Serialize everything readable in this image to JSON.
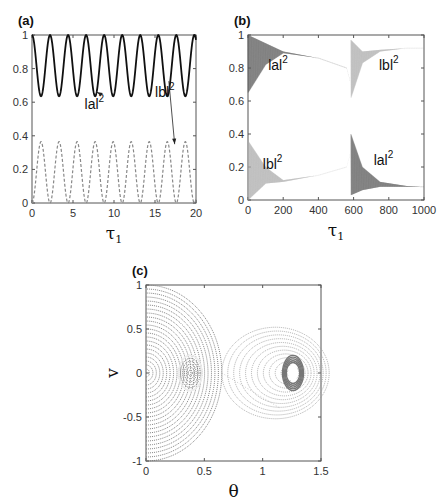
{
  "chart_data": [
    {
      "id": "a",
      "type": "line",
      "panel_label": "(a)",
      "xlabel": "τ",
      "xlabel_sub": "1",
      "ylabel": "",
      "xlim": [
        0,
        20
      ],
      "ylim": [
        0,
        1
      ],
      "xticks": [
        "0",
        "5",
        "10",
        "15",
        "20"
      ],
      "xtick_values": [
        0,
        5,
        10,
        15,
        20
      ],
      "yticks": [
        "0",
        "0.2",
        "0.4",
        "0.6",
        "0.8",
        "1"
      ],
      "ytick_values": [
        0,
        0.2,
        0.4,
        0.6,
        0.8,
        1
      ],
      "period": 2.2,
      "series": [
        {
          "name": "|a|²",
          "style": "solid",
          "color": "#111111",
          "min": 0.635,
          "max": 1.0
        },
        {
          "name": "|b|²",
          "style": "dashed",
          "color": "#888888",
          "min": 0.0,
          "max": 0.365
        }
      ],
      "annotations": [
        {
          "text": "lal",
          "sup": "2",
          "x": 7.6,
          "y": 0.56,
          "arrow_to": [
            7.9,
            0.66
          ]
        },
        {
          "text": "lbl",
          "sup": "2",
          "x": 16.2,
          "y": 0.63,
          "arrow_to": [
            17.4,
            0.35
          ]
        }
      ]
    },
    {
      "id": "b",
      "type": "area",
      "panel_label": "(b)",
      "xlabel": "τ",
      "xlabel_sub": "1",
      "xlim": [
        0,
        1000
      ],
      "ylim": [
        0,
        1
      ],
      "xticks": [
        "0",
        "200",
        "400",
        "600",
        "800",
        "1000"
      ],
      "xtick_values": [
        0,
        200,
        400,
        600,
        800,
        1000
      ],
      "yticks": [
        "0",
        "0.2",
        "0.4",
        "0.6",
        "0.8",
        "1"
      ],
      "ytick_values": [
        0,
        0.2,
        0.4,
        0.6,
        0.8,
        1
      ],
      "switch_x": 580,
      "series": [
        {
          "name": "|a|² (before switch)",
          "color": "#555555",
          "envelope_upper": [
            [
              0,
              1.0
            ],
            [
              100,
              0.95
            ],
            [
              200,
              0.9
            ],
            [
              400,
              0.86
            ],
            [
              560,
              0.8
            ],
            [
              580,
              0.72
            ]
          ],
          "envelope_lower": [
            [
              0,
              0.65
            ],
            [
              100,
              0.82
            ],
            [
              200,
              0.89
            ],
            [
              400,
              0.86
            ],
            [
              560,
              0.8
            ],
            [
              580,
              0.72
            ]
          ]
        },
        {
          "name": "|b|² (before switch)",
          "color": "#aaaaaa",
          "envelope_upper": [
            [
              0,
              0.36
            ],
            [
              100,
              0.2
            ],
            [
              200,
              0.12
            ],
            [
              400,
              0.15
            ],
            [
              560,
              0.2
            ],
            [
              580,
              0.28
            ]
          ],
          "envelope_lower": [
            [
              0,
              0.0
            ],
            [
              100,
              0.1
            ],
            [
              200,
              0.11
            ],
            [
              400,
              0.15
            ],
            [
              560,
              0.2
            ],
            [
              580,
              0.28
            ]
          ]
        },
        {
          "name": "|b|² (after switch)",
          "color": "#aaaaaa",
          "envelope_upper": [
            [
              585,
              0.97
            ],
            [
              650,
              0.9
            ],
            [
              750,
              0.91
            ],
            [
              900,
              0.92
            ],
            [
              1000,
              0.92
            ]
          ],
          "envelope_lower": [
            [
              585,
              0.62
            ],
            [
              650,
              0.83
            ],
            [
              750,
              0.9
            ],
            [
              900,
              0.92
            ],
            [
              1000,
              0.92
            ]
          ]
        },
        {
          "name": "|a|² (after switch)",
          "color": "#555555",
          "envelope_upper": [
            [
              585,
              0.4
            ],
            [
              650,
              0.2
            ],
            [
              750,
              0.11
            ],
            [
              900,
              0.085
            ],
            [
              1000,
              0.08
            ]
          ],
          "envelope_lower": [
            [
              585,
              0.03
            ],
            [
              650,
              0.06
            ],
            [
              750,
              0.08
            ],
            [
              900,
              0.08
            ],
            [
              1000,
              0.08
            ]
          ]
        }
      ],
      "annotations": [
        {
          "text": "lal",
          "sup": "2",
          "x": 170,
          "y": 0.79
        },
        {
          "text": "lbl",
          "sup": "2",
          "x": 140,
          "y": 0.19
        },
        {
          "text": "lbl",
          "sup": "2",
          "x": 800,
          "y": 0.79
        },
        {
          "text": "lal",
          "sup": "2",
          "x": 770,
          "y": 0.21
        }
      ]
    },
    {
      "id": "c",
      "type": "scatter",
      "panel_label": "(c)",
      "xlabel": "θ",
      "ylabel": "v",
      "xlim": [
        0,
        1.5
      ],
      "ylim": [
        -1,
        1
      ],
      "xticks": [
        "0",
        "0.5",
        "1",
        "1.5"
      ],
      "xtick_values": [
        0,
        0.5,
        1,
        1.5
      ],
      "yticks": [
        "-1",
        "-0.5",
        "0",
        "0.5",
        "1"
      ],
      "ytick_values": [
        -1,
        -0.5,
        0,
        0.5,
        1
      ],
      "regions": [
        {
          "name": "left-orbits",
          "color": "#777777",
          "center": [
            0.4,
            0.0
          ],
          "extent_theta": [
            0,
            0.65
          ],
          "extent_v": [
            -1,
            1
          ]
        },
        {
          "name": "right-orbits",
          "color": "#999999",
          "center": [
            1.26,
            0.0
          ],
          "extent_theta": [
            0.8,
            1.38
          ],
          "extent_v": [
            -0.52,
            0.52
          ]
        }
      ]
    }
  ]
}
